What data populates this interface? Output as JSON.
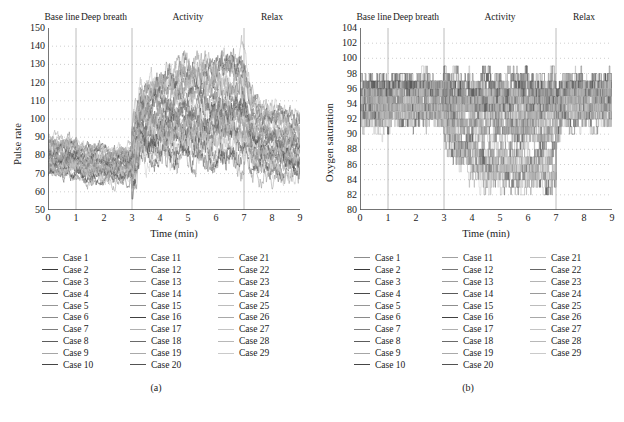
{
  "figure": {
    "bottom_caption": "",
    "panels": [
      {
        "id": "a",
        "subcaption": "(a)",
        "ylabel": "Pulse rate",
        "xlabel": "Time (min)"
      },
      {
        "id": "b",
        "subcaption": "(b)",
        "ylabel": "Oxygen saturation",
        "xlabel": "Time (min)"
      }
    ]
  },
  "legend": {
    "columns": [
      [
        "Case 1",
        "Case 2",
        "Case 3",
        "Case 4",
        "Case 5",
        "Case 6",
        "Case 7",
        "Case 8",
        "Case 9",
        "Case 10"
      ],
      [
        "Case 11",
        "Case 12",
        "Case 13",
        "Case 14",
        "Case 15",
        "Case 16",
        "Case 17",
        "Case 18",
        "Case 19",
        "Case 20"
      ],
      [
        "Case 21",
        "Case 22",
        "Case 23",
        "Case 24",
        "Case 25",
        "Case 26",
        "Case 27",
        "Case 28",
        "Case 29"
      ]
    ],
    "swatch_colors": [
      "#8c8c8c",
      "#3a3a3a",
      "#707070",
      "#4a4a4a",
      "#969696",
      "#8a8a8a",
      "#7e7e7e",
      "#5c5c5c",
      "#a6a6a6",
      "#454545",
      "#a0a0a0",
      "#787878",
      "#9c9c9c",
      "#5a5a5a",
      "#8e8e8e",
      "#404040",
      "#b0b0b0",
      "#6a6a6a",
      "#aaaaaa",
      "#525252",
      "#c0c0c0",
      "#666666",
      "#b4b4b4",
      "#9a9a9a",
      "#bcbcbc",
      "#a8a8a8",
      "#c4c4c4",
      "#b8b8b8",
      "#cacaca"
    ]
  },
  "chart_data": [
    {
      "type": "line",
      "panel": "a",
      "title": "",
      "xlabel": "Time (min)",
      "ylabel": "Pulse rate",
      "xlim": [
        0,
        9
      ],
      "ylim": [
        50,
        150
      ],
      "xticks": [
        0,
        1,
        2,
        3,
        4,
        5,
        6,
        7,
        8,
        9
      ],
      "yticks": [
        50,
        60,
        70,
        80,
        90,
        100,
        110,
        120,
        130,
        140,
        150
      ],
      "grid": "horizontal-dotted",
      "legend_position": "below",
      "n_series": 29,
      "series_names": [
        "Case 1",
        "Case 2",
        "Case 3",
        "Case 4",
        "Case 5",
        "Case 6",
        "Case 7",
        "Case 8",
        "Case 9",
        "Case 10",
        "Case 11",
        "Case 12",
        "Case 13",
        "Case 14",
        "Case 15",
        "Case 16",
        "Case 17",
        "Case 18",
        "Case 19",
        "Case 20",
        "Case 21",
        "Case 22",
        "Case 23",
        "Case 24",
        "Case 25",
        "Case 26",
        "Case 27",
        "Case 28",
        "Case 29"
      ],
      "phases": [
        {
          "label": "Base line",
          "start": 0,
          "end": 1,
          "center": 0.5
        },
        {
          "label": "Deep breath",
          "start": 1,
          "end": 3,
          "center": 2.0
        },
        {
          "label": "Activity",
          "start": 3,
          "end": 7,
          "center": 5.0
        },
        {
          "label": "Relax",
          "start": 7,
          "end": 9,
          "center": 8.0
        }
      ],
      "phase_dividers": [
        1,
        3,
        7
      ],
      "phase_profile": [
        {
          "phase": "Base line",
          "t0": 0,
          "t1": 1,
          "mean": 79,
          "spread": 11,
          "noise": 4.5
        },
        {
          "phase": "Deep breath",
          "t0": 1,
          "t1": 3,
          "mean": 75,
          "spread": 10,
          "noise": 4.0
        },
        {
          "phase": "Activity",
          "t0": 3,
          "t1": 7,
          "mean": 95,
          "spread": 24,
          "noise": 8.0
        },
        {
          "phase": "Relax",
          "t0": 7,
          "t1": 9,
          "mean": 84,
          "spread": 18,
          "noise": 6.0
        }
      ],
      "observed_range": {
        "min": 56,
        "max": 148
      },
      "sample_interval_min": 0.0125,
      "notes": "29 overlaid per-subject pulse-rate traces; sharp rise at t=3 min (activity onset) and decay after t=7 min (relax)."
    },
    {
      "type": "line",
      "panel": "b",
      "title": "",
      "xlabel": "Time (min)",
      "ylabel": "Oxygen saturation",
      "xlim": [
        0,
        9
      ],
      "ylim": [
        80,
        104
      ],
      "xticks": [
        0,
        1,
        2,
        3,
        4,
        5,
        6,
        7,
        8,
        9
      ],
      "yticks": [
        80,
        82,
        84,
        86,
        88,
        90,
        92,
        94,
        96,
        98,
        100,
        102,
        104
      ],
      "grid": "horizontal-dotted",
      "legend_position": "below",
      "n_series": 29,
      "series_names": [
        "Case 1",
        "Case 2",
        "Case 3",
        "Case 4",
        "Case 5",
        "Case 6",
        "Case 7",
        "Case 8",
        "Case 9",
        "Case 10",
        "Case 11",
        "Case 12",
        "Case 13",
        "Case 14",
        "Case 15",
        "Case 16",
        "Case 17",
        "Case 18",
        "Case 19",
        "Case 20",
        "Case 21",
        "Case 22",
        "Case 23",
        "Case 24",
        "Case 25",
        "Case 26",
        "Case 27",
        "Case 28",
        "Case 29"
      ],
      "phases": [
        {
          "label": "Base line",
          "start": 0,
          "end": 1,
          "center": 0.5
        },
        {
          "label": "Deep breath",
          "start": 1,
          "end": 3,
          "center": 2.0
        },
        {
          "label": "Activity",
          "start": 3,
          "end": 7,
          "center": 5.0
        },
        {
          "label": "Relax",
          "start": 7,
          "end": 9,
          "center": 8.0
        }
      ],
      "phase_dividers": [
        1,
        3,
        7
      ],
      "phase_profile": [
        {
          "phase": "Base line",
          "t0": 0,
          "t1": 1,
          "mean": 94.0,
          "spread": 3.2,
          "noise": 1.6
        },
        {
          "phase": "Deep breath",
          "t0": 1,
          "t1": 3,
          "mean": 94.5,
          "spread": 3.0,
          "noise": 1.6
        },
        {
          "phase": "Activity",
          "t0": 3,
          "t1": 7,
          "mean": 92.5,
          "spread": 5.0,
          "noise": 2.2
        },
        {
          "phase": "Relax",
          "t0": 7,
          "t1": 9,
          "mean": 94.5,
          "spread": 3.0,
          "noise": 1.7
        }
      ],
      "observed_range": {
        "min": 82,
        "max": 99
      },
      "quantized_to_integers": true,
      "sample_interval_min": 0.0125,
      "notes": "29 overlaid SpO2 traces, integer-quantized step traces; desaturation dips to 82-86 during activity phase."
    }
  ]
}
